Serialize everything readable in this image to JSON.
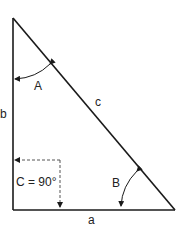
{
  "diagram": {
    "type": "right-triangle",
    "colors": {
      "stroke": "#1a1a1a",
      "dashed": "#555555",
      "text": "#222222"
    },
    "sides": {
      "a": {
        "label": "a",
        "position": "bottom"
      },
      "b": {
        "label": "b",
        "position": "left"
      },
      "c": {
        "label": "c",
        "position": "hypotenuse"
      }
    },
    "angles": {
      "A": {
        "label": "A",
        "vertex": "top"
      },
      "B": {
        "label": "B",
        "vertex": "bottom-right"
      },
      "C": {
        "label": "C = 90°",
        "vertex": "bottom-left",
        "style": "dashed-right-angle"
      }
    }
  }
}
